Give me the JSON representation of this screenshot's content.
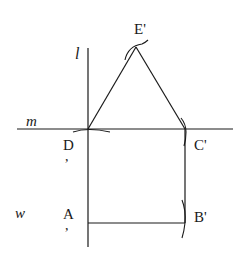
{
  "diagram": {
    "type": "geometric-construction",
    "lines": {
      "l": "l",
      "m": "m",
      "w": "w"
    },
    "points": {
      "E": "E'",
      "D": "D",
      "C": "C'",
      "A": "A",
      "B": "B'"
    },
    "primes_detached": {
      "D": ",",
      "A": ","
    },
    "shapes": [
      "equilateral triangle D-C'-E'",
      "square A-B'-C'-D"
    ],
    "colors": {
      "stroke": "#1a1a1a",
      "background": "#ffffff"
    }
  }
}
